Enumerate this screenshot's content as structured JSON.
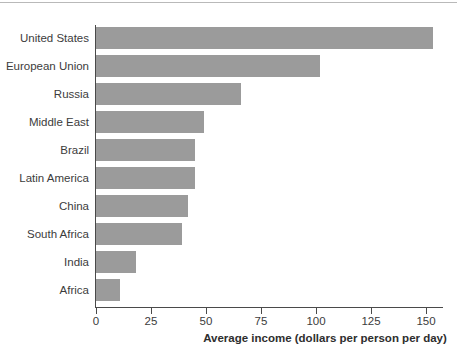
{
  "chart_data": {
    "type": "bar",
    "orientation": "horizontal",
    "title": "",
    "xlabel": "Average income (dollars per person per day)",
    "ylabel": "",
    "categories": [
      "United States",
      "European Union",
      "Russia",
      "Middle East",
      "Brazil",
      "Latin America",
      "China",
      "South Africa",
      "India",
      "Africa"
    ],
    "values": [
      153,
      102,
      66,
      49,
      45,
      45,
      42,
      39,
      18,
      11
    ],
    "xlim": [
      0,
      158
    ],
    "xticks": [
      0,
      25,
      50,
      75,
      100,
      125,
      150
    ],
    "xtick_labels": [
      "0",
      "25",
      "50",
      "75",
      "100",
      "125",
      "150"
    ],
    "grid": false,
    "legend": null,
    "bar_color": "#9b9b9b",
    "axis_color": "#4a4a4a",
    "background": "#ffffff"
  },
  "axis": {
    "x_title": "Average income (dollars per person per day)"
  }
}
